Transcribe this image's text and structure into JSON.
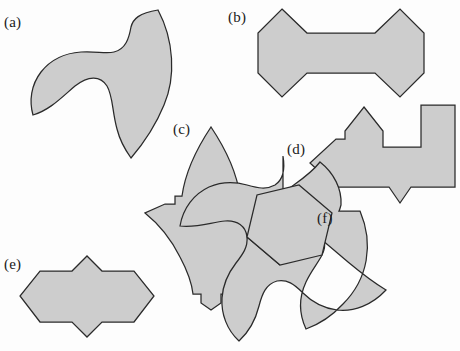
{
  "figure": {
    "width": 460,
    "height": 351,
    "background_color": "#fdfdfd",
    "shape_fill_color": "#cdcdcd",
    "shape_stroke_color": "#2a2a2a"
  },
  "panels": [
    {
      "id": "a",
      "label": "(a)",
      "label_x": 4,
      "label_y": 15,
      "shape_name": "three-arm-curved-pinwheel",
      "shape_kind": "curved-pinwheel",
      "hole": false
    },
    {
      "id": "b",
      "label": "(b)",
      "label_x": 228,
      "label_y": 10,
      "shape_name": "double-hexagon-bowtie-polygon",
      "shape_kind": "polygon",
      "hole": false
    },
    {
      "id": "c",
      "label": "(c)",
      "label_x": 173,
      "label_y": 122,
      "shape_name": "pointed-leaf-with-notches",
      "shape_kind": "curved-polygon",
      "hole": false
    },
    {
      "id": "d",
      "label": "(d)",
      "label_x": 287,
      "label_y": 142,
      "shape_name": "stepped-arrow-polygon",
      "shape_kind": "polygon",
      "hole": false
    },
    {
      "id": "e",
      "label": "(e)",
      "label_x": 4,
      "label_y": 257,
      "shape_name": "elongated-hexagon-with-spikes",
      "shape_kind": "polygon",
      "hole": false
    },
    {
      "id": "f",
      "label": "(f)",
      "label_x": 317,
      "label_y": 211,
      "shape_name": "three-arm-pinwheel-with-hexagon-hole",
      "shape_kind": "curved-pinwheel",
      "hole": true
    }
  ]
}
